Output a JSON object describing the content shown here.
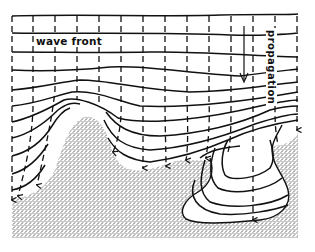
{
  "figure": {
    "type": "wave-refraction-diagram",
    "labels": {
      "wave_front": "wave front",
      "propagation": "propagation"
    },
    "legend_semantics": {
      "solid_lines": "wave fronts",
      "dashed_lines": "wave rays (orthogonals) with arrowheads",
      "stippled_area": "land / shallow seafloor (headland)",
      "white_embayment": "submarine canyon"
    },
    "icons": {
      "propagation_arrow": "arrow-down-icon"
    },
    "colors": {
      "ink": "#111111",
      "background": "#ffffff",
      "stipple": "#222222"
    }
  }
}
